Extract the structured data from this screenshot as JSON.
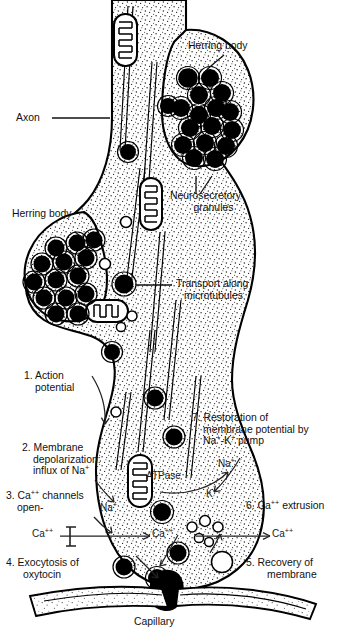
{
  "figure": {
    "kind": "biological-diagram",
    "style": "black and white stippled line drawing"
  },
  "labels": {
    "axon": "Axon",
    "herring_body_top": "Herring body",
    "herring_body_left": "Herring body",
    "neurosecretory_granules_l1": "Neurosecretory",
    "neurosecretory_granules_l2": "granules",
    "transport_l1": "Transport along",
    "transport_l2": "microtubules",
    "capillary": "Capillary",
    "atpase": "ATPase"
  },
  "steps": [
    {
      "num": "1.",
      "lines": [
        "Action",
        "potential"
      ]
    },
    {
      "num": "2.",
      "lines": [
        "Membrane",
        "depolarization:",
        "influx of Na+"
      ]
    },
    {
      "num": "3.",
      "lines": [
        "Ca++ channels",
        "open-"
      ]
    },
    {
      "num": "4.",
      "lines": [
        "Exocytosis of",
        "oxytocin"
      ]
    },
    {
      "num": "5.",
      "lines": [
        "Recovery of",
        "membrane"
      ]
    },
    {
      "num": "6.",
      "lines": [
        "Ca++ extrusion"
      ]
    },
    {
      "num": "7.",
      "lines": [
        "Restoration of",
        "membrane potential by",
        "Na+-K+ pump"
      ]
    }
  ],
  "step_text": {
    "s1l1": "1. Action",
    "s1l2": "potential",
    "s2l1": "2. Membrane",
    "s2l2": "depolarization:",
    "s2l3a": "influx of Na",
    "s2l3b": "+",
    "s3l1a": "3. Ca",
    "s3l1b": "++",
    "s3l1c": " channels",
    "s3l2": "open-",
    "s4l1": "4. Exocytosis of",
    "s4l2": "oxytocin",
    "s5l1": "5. Recovery of",
    "s5l2": "membrane",
    "s6a": "6. Ca",
    "s6b": "++",
    "s6c": " extrusion",
    "s7l1": "7. Restoration of",
    "s7l2": "membrane potential by",
    "s7l3a": "Na",
    "s7l3b": "+",
    "s7l3c": "-K",
    "s7l3d": "+",
    "s7l3e": " pump"
  },
  "ions": {
    "na_left": "Na",
    "na_left_sup": "+",
    "na_right": "Na",
    "na_right_sup": "+",
    "k_right": "K",
    "k_right_sup": "+",
    "ca_outside_left": "Ca",
    "ca_outside_left_sup": "++",
    "ca_inside": "Ca",
    "ca_inside_sup": "++",
    "ca_outside_right": "Ca",
    "ca_outside_right_sup": "++"
  },
  "colors": {
    "ink": "#000000",
    "background": "#ffffff",
    "stipple": "#2b2b2b",
    "granule_fill": "#000000",
    "leader": "#111111"
  }
}
